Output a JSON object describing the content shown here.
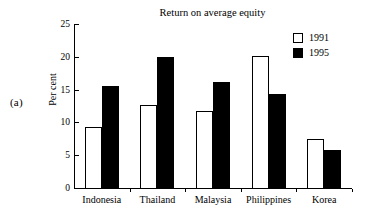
{
  "panel": {
    "label": "(a)"
  },
  "chart_data": {
    "type": "bar",
    "title": "Return on average equity",
    "xlabel": "",
    "ylabel": "Per cent",
    "ylim": [
      0,
      25
    ],
    "yticks": [
      0,
      5,
      10,
      15,
      20,
      25
    ],
    "ytick_labels": [
      "0",
      "5",
      "10",
      "15",
      "20",
      "25"
    ],
    "grid": false,
    "legend_position": "top-right",
    "categories": [
      "Indonesia",
      "Thailand",
      "Malaysia",
      "Philippines",
      "Korea"
    ],
    "series": [
      {
        "name": "1991",
        "style": "open",
        "color": "#ffffff",
        "edge_color": "#000000",
        "values": [
          9.3,
          12.7,
          11.8,
          20.1,
          7.5
        ]
      },
      {
        "name": "1995",
        "style": "solid",
        "color": "#000000",
        "edge_color": "#000000",
        "values": [
          15.5,
          20.0,
          16.1,
          14.3,
          5.8
        ]
      }
    ]
  },
  "legend": {
    "entries": [
      {
        "label": "1991",
        "swatch": "open-square-icon"
      },
      {
        "label": "1995",
        "swatch": "filled-square-icon"
      }
    ]
  }
}
